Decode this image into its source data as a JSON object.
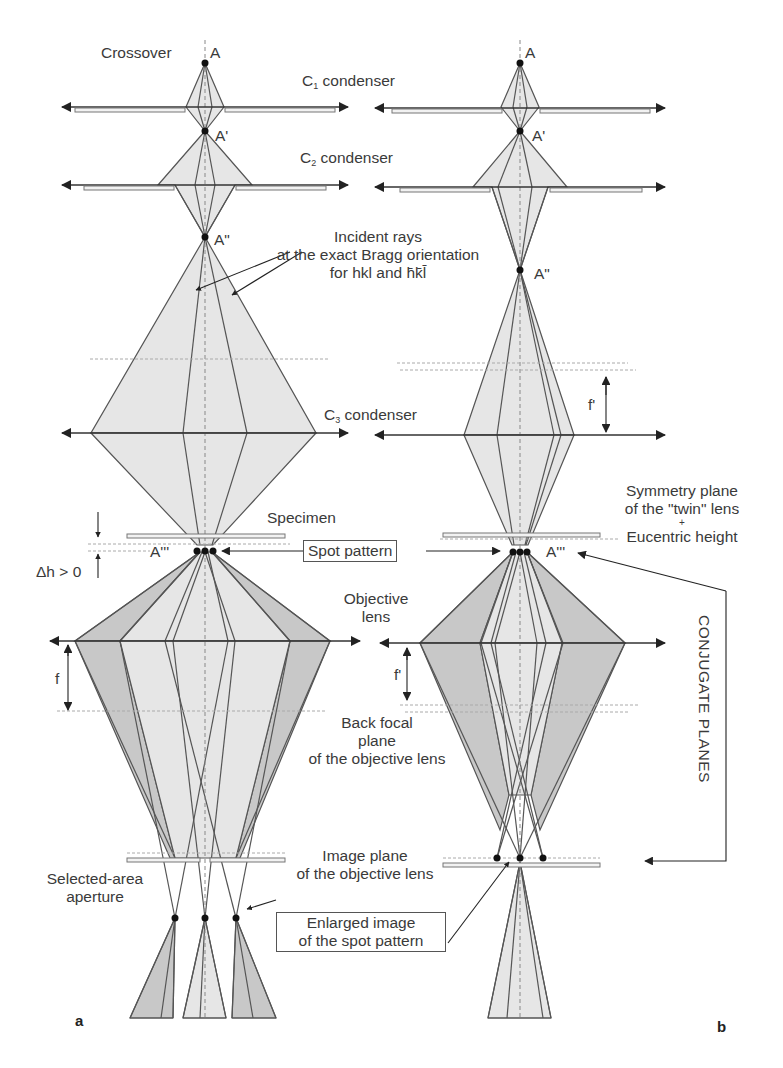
{
  "figure": {
    "panels": [
      "a",
      "b"
    ],
    "labels": {
      "crossover": "Crossover",
      "point_A": "A",
      "point_A1": "A'",
      "point_A2": "A\"",
      "point_A3": "A'''",
      "c1_prefix": "C",
      "c1_sub": "1",
      "c1_suffix": " condenser",
      "c2_prefix": "C",
      "c2_sub": "2",
      "c2_suffix": " condenser",
      "c3_prefix": "C",
      "c3_sub": "3",
      "c3_suffix": " condenser",
      "incident_rays": [
        "Incident rays",
        "at the exact Bragg orientation",
        "for hkl and h̄k̄l̄"
      ],
      "specimen": "Specimen",
      "spot_pattern": "Spot pattern",
      "delta_h": "Δh > 0",
      "objective_lens": [
        "Objective",
        "lens"
      ],
      "f": "f",
      "f_prime": "f'",
      "back_focal_plane": [
        "Back focal",
        "plane",
        "of the objective lens"
      ],
      "image_plane": [
        "Image plane",
        "of the objective lens"
      ],
      "selected_area_aperture": [
        "Selected-area",
        "aperture"
      ],
      "enlarged_image": [
        "Enlarged image",
        "of the spot pattern"
      ],
      "symmetry_plane": [
        "Symmetry plane",
        "of the \"twin\" lens",
        "+",
        "Eucentric height"
      ],
      "conjugate_planes": "CONJUGATE PLANES"
    },
    "colors": {
      "line": "#555555",
      "fill_light": "#e6e6e6",
      "fill_dark": "#c8c8c8",
      "text": "#3a3a3a"
    }
  }
}
